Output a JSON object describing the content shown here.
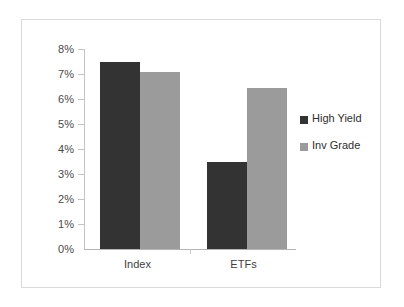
{
  "chart_data": {
    "type": "bar",
    "title": "",
    "subtitle": "",
    "xlabel": "",
    "ylabel": "",
    "categories": [
      "Index",
      "ETFs"
    ],
    "series": [
      {
        "name": "High Yield",
        "color": "#333333",
        "values": [
          7.5,
          3.5
        ]
      },
      {
        "name": "Inv Grade",
        "color": "#9b9b9b",
        "values": [
          7.1,
          6.45
        ]
      }
    ],
    "ylim": [
      0,
      8
    ],
    "ytick_values": [
      0,
      1,
      2,
      3,
      4,
      5,
      6,
      7,
      8
    ],
    "ytick_labels": [
      "0%",
      "1%",
      "2%",
      "3%",
      "4%",
      "5%",
      "6%",
      "7%",
      "8%"
    ],
    "grid": false,
    "legend_position": "right",
    "annotations": []
  },
  "axis": {
    "y": {
      "labels": [
        "8%",
        "7%",
        "6%",
        "5%",
        "4%",
        "3%",
        "2%",
        "1%",
        "0%"
      ]
    },
    "x": {
      "labels": [
        "Index",
        "ETFs"
      ]
    }
  },
  "legend": {
    "items": [
      {
        "label": "High Yield",
        "swatch": "legend-swatch-high-yield"
      },
      {
        "label": "Inv Grade",
        "swatch": "legend-swatch-inv-grade"
      }
    ]
  },
  "bars": [
    {
      "group": "Index",
      "series": "High Yield",
      "value": 7.5
    },
    {
      "group": "Index",
      "series": "Inv Grade",
      "value": 7.1
    },
    {
      "group": "ETFs",
      "series": "High Yield",
      "value": 3.5
    },
    {
      "group": "ETFs",
      "series": "Inv Grade",
      "value": 6.45
    }
  ],
  "colors": {
    "high_yield": "#333333",
    "inv_grade": "#9b9b9b",
    "frame": "#d9d9d9",
    "axis": "#c4c4c4",
    "background": "#ffffff",
    "text": "#3f3f3f"
  }
}
